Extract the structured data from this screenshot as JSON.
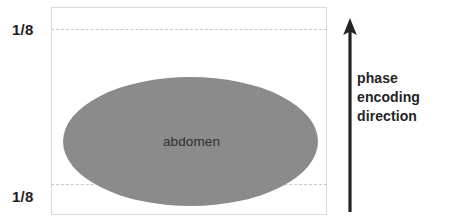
{
  "figure": {
    "background_color": "#ffffff"
  },
  "fov_box": {
    "border_color": "#d9d9d9",
    "fill_color": "#ffffff"
  },
  "dashed_lines": {
    "color": "#c9c9c9",
    "top_label": "1/8",
    "bottom_label": "1/8"
  },
  "object": {
    "label": "abdomen",
    "fill_color": "#8b8b8b",
    "text_color": "#2f2f2f"
  },
  "arrow": {
    "name": "phase-encoding-arrow",
    "direction": "up",
    "color": "#242424"
  },
  "caption": {
    "line1": "phase",
    "line2": "encoding",
    "line3": "direction",
    "color": "#242424"
  }
}
